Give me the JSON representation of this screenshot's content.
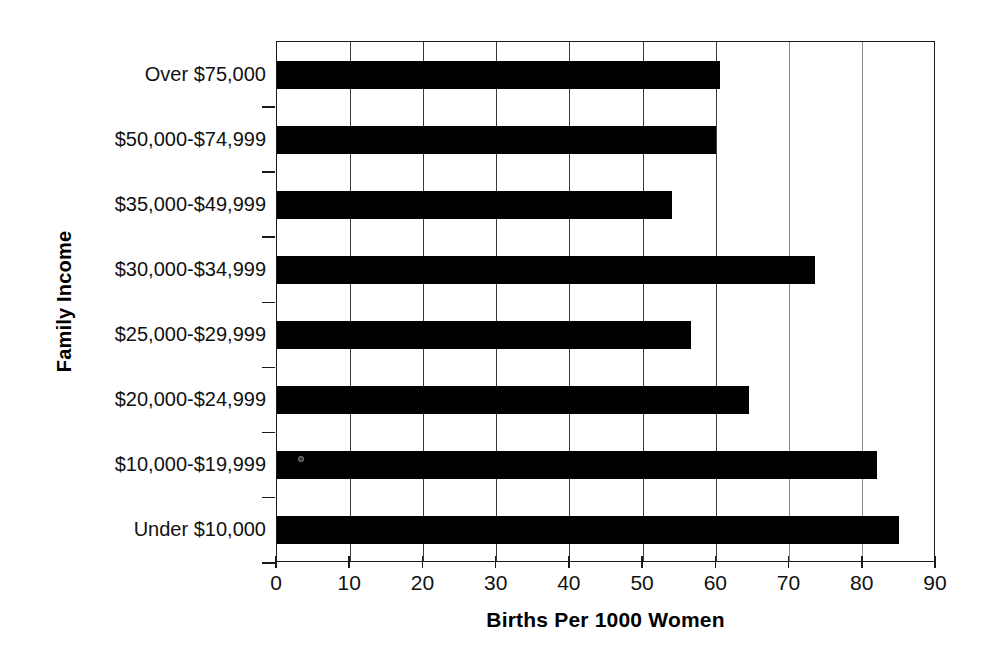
{
  "chart_data": {
    "type": "bar",
    "orientation": "horizontal",
    "title": "",
    "xlabel": "Births Per 1000 Women",
    "ylabel": "Family Income",
    "xlim": [
      0,
      90
    ],
    "xticks": [
      0,
      10,
      20,
      30,
      40,
      50,
      60,
      70,
      80,
      90
    ],
    "xtick_labels": [
      "0",
      "10",
      "20",
      "30",
      "40",
      "50",
      "60",
      "70",
      "80",
      "90"
    ],
    "grid": "vertical",
    "legend": "none",
    "bar_color": "#000000",
    "categories": [
      "Over $75,000",
      "$50,000-$74,999",
      "$35,000-$49,999",
      "$30,000-$34,999",
      "$25,000-$29,999",
      "$20,000-$24,999",
      "$10,000-$19,999",
      "Under $10,000"
    ],
    "values": [
      60.5,
      60.0,
      54.0,
      73.5,
      56.5,
      64.5,
      82.0,
      85.0
    ]
  },
  "axes": {
    "x_title": "Births Per 1000 Women",
    "y_title": "Family Income"
  }
}
